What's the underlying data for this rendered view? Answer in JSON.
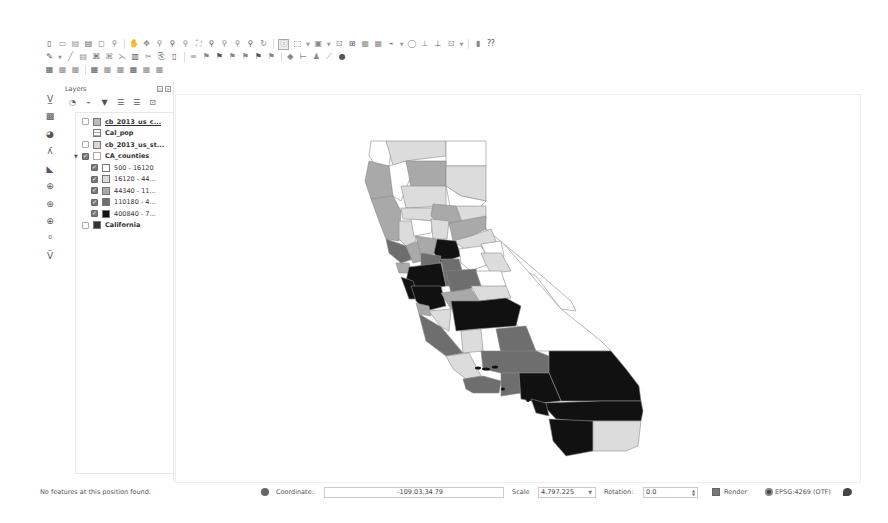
{
  "toolbar": {
    "row1_icons": [
      {
        "name": "new-project-icon",
        "glyph": "▯"
      },
      {
        "name": "open-project-icon",
        "glyph": "▭"
      },
      {
        "name": "save-project-icon",
        "glyph": "▤"
      },
      {
        "name": "save-as-icon",
        "glyph": "▤"
      },
      {
        "name": "new-print-composer-icon",
        "glyph": "◻"
      },
      {
        "name": "composer-manager-icon",
        "glyph": "⚲"
      },
      {
        "name": "pan-map-icon",
        "glyph": "✋"
      },
      {
        "name": "pan-to-selection-icon",
        "glyph": "✥"
      },
      {
        "name": "zoom-in-icon",
        "glyph": "⚲"
      },
      {
        "name": "zoom-out-icon",
        "glyph": "⚲"
      },
      {
        "name": "zoom-full-icon",
        "glyph": "⚲"
      },
      {
        "name": "zoom-to-selection-icon",
        "glyph": "⛶"
      },
      {
        "name": "zoom-to-layer-icon",
        "glyph": "⚲"
      },
      {
        "name": "zoom-native-icon",
        "glyph": "⚲"
      },
      {
        "name": "zoom-last-icon",
        "glyph": "⚲"
      },
      {
        "name": "zoom-next-icon",
        "glyph": "⚲"
      },
      {
        "name": "refresh-icon",
        "glyph": "↻"
      },
      {
        "name": "identify-features-icon",
        "glyph": "ⓘ",
        "active": true
      },
      {
        "name": "select-features-icon",
        "glyph": "⬚",
        "dropdown": true
      },
      {
        "name": "select-by-area-icon",
        "glyph": "▣",
        "dropdown": true
      },
      {
        "name": "deselect-all-icon",
        "glyph": "⊡"
      },
      {
        "name": "select-by-expression-icon",
        "glyph": "⊞"
      },
      {
        "name": "open-attribute-table-icon",
        "glyph": "▦"
      },
      {
        "name": "field-calculator-icon",
        "glyph": "▦"
      },
      {
        "name": "measure-line-icon",
        "glyph": "⌁",
        "dropdown": true
      },
      {
        "name": "map-tips-icon",
        "glyph": "◯"
      },
      {
        "name": "new-bookmark-icon",
        "glyph": "⊥"
      },
      {
        "name": "show-bookmarks-icon",
        "glyph": "⊥"
      },
      {
        "name": "text-annotation-icon",
        "glyph": "⊡",
        "dropdown": true
      },
      {
        "name": "python-console-icon",
        "glyph": "▮"
      },
      {
        "name": "help-icon",
        "glyph": "⁇"
      }
    ],
    "row2_icons": [
      {
        "name": "current-edits-icon",
        "glyph": "✎",
        "dropdown": true
      },
      {
        "name": "toggle-editing-icon",
        "glyph": "╱"
      },
      {
        "name": "save-edits-icon",
        "glyph": "▤"
      },
      {
        "name": "add-feature-icon",
        "glyph": "⌘"
      },
      {
        "name": "move-feature-icon",
        "glyph": "⌘"
      },
      {
        "name": "node-tool-icon",
        "glyph": "⋋"
      },
      {
        "name": "delete-selected-icon",
        "glyph": "▥"
      },
      {
        "name": "cut-features-icon",
        "glyph": "✂"
      },
      {
        "name": "copy-features-icon",
        "glyph": "⎘"
      },
      {
        "name": "paste-features-icon",
        "glyph": "▯"
      },
      {
        "name": "label-tool-icon",
        "glyph": "≡"
      },
      {
        "name": "pin-labels-icon",
        "glyph": "⚑"
      },
      {
        "name": "show-hide-labels-icon",
        "glyph": "⚑"
      },
      {
        "name": "move-label-icon",
        "glyph": "⚑"
      },
      {
        "name": "rotate-label-icon",
        "glyph": "⚑"
      },
      {
        "name": "change-label-icon",
        "glyph": "⚑"
      },
      {
        "name": "label-diagram-icon",
        "glyph": "⚑"
      },
      {
        "name": "gps-tool-icon",
        "glyph": "◆"
      },
      {
        "name": "measure-area-icon",
        "glyph": "⊢"
      },
      {
        "name": "plugin-a-icon",
        "glyph": "♟"
      },
      {
        "name": "plugin-b-icon",
        "glyph": "⟋"
      },
      {
        "name": "plugin-c-icon",
        "glyph": "●"
      }
    ],
    "row3_icons": [
      {
        "name": "add-vector-layer-icon",
        "glyph": "▦"
      },
      {
        "name": "add-raster-layer-icon",
        "glyph": "▦"
      },
      {
        "name": "add-postgis-layer-icon",
        "glyph": "▦"
      },
      {
        "name": "add-spatialite-layer-icon",
        "glyph": "▦"
      },
      {
        "name": "add-mssql-layer-icon",
        "glyph": "▦"
      },
      {
        "name": "add-oracle-layer-icon",
        "glyph": "▦"
      },
      {
        "name": "add-wms-layer-icon",
        "glyph": "▦"
      },
      {
        "name": "add-wcs-layer-icon",
        "glyph": "▦"
      },
      {
        "name": "add-wfs-layer-icon",
        "glyph": "▦"
      }
    ]
  },
  "left_toolbar": {
    "icons": [
      {
        "name": "add-delimited-text-icon",
        "glyph": "V̲"
      },
      {
        "name": "add-raster-tool-icon",
        "glyph": "▩"
      },
      {
        "name": "add-spatialite-tool-icon",
        "glyph": "◕"
      },
      {
        "name": "add-gpx-icon",
        "glyph": "ʎ"
      },
      {
        "name": "add-mssql-tool-icon",
        "glyph": "◣"
      },
      {
        "name": "add-wms-tool-icon",
        "glyph": "⊕"
      },
      {
        "name": "add-wcs-tool-icon",
        "glyph": "⊛"
      },
      {
        "name": "add-wfs-tool-icon",
        "glyph": "⊕"
      },
      {
        "name": "new-shapefile-icon",
        "glyph": "⁰"
      },
      {
        "name": "new-spatialite-layer-icon",
        "glyph": "V̈"
      }
    ]
  },
  "layers_panel": {
    "title": "Layers",
    "toolbar_icons": [
      {
        "name": "open-layer-styling-icon",
        "glyph": "◔"
      },
      {
        "name": "add-group-icon",
        "glyph": "⌁"
      },
      {
        "name": "filter-legend-icon",
        "glyph": "▼"
      },
      {
        "name": "expand-all-icon",
        "glyph": "☰"
      },
      {
        "name": "collapse-all-icon",
        "glyph": "☰"
      },
      {
        "name": "remove-layer-icon",
        "glyph": "⊡"
      }
    ],
    "layers": [
      {
        "label": "cb_2013_us_c...",
        "checked": false,
        "swatch": "#bbbbbb",
        "indent": 0,
        "bold": true,
        "underline": true
      },
      {
        "label": "Cal_pop",
        "checked": null,
        "swatch": "table",
        "indent": 0,
        "bold": true
      },
      {
        "label": "cb_2013_us_st...",
        "checked": false,
        "swatch": "#d8d8d8",
        "indent": 0,
        "bold": true
      },
      {
        "label": "CA_counties",
        "checked": true,
        "swatch": "outline",
        "indent": 0,
        "bold": true,
        "expanded": true
      },
      {
        "label": "500 - 16120",
        "checked": true,
        "swatch": "#ffffff",
        "indent": 1
      },
      {
        "label": "16120 - 44...",
        "checked": true,
        "swatch": "#dcdcdc",
        "indent": 1
      },
      {
        "label": "44340 - 11...",
        "checked": true,
        "swatch": "#a9a9a9",
        "indent": 1
      },
      {
        "label": "110180 - 4...",
        "checked": true,
        "swatch": "#6e6e6e",
        "indent": 1
      },
      {
        "label": "400840 - 7...",
        "checked": true,
        "swatch": "#111111",
        "indent": 1
      },
      {
        "label": "California",
        "checked": false,
        "swatch": "#333333",
        "indent": 0,
        "bold": true
      }
    ]
  },
  "map": {
    "legend_colors": {
      "c0": "#ffffff",
      "c1": "#dcdcdc",
      "c2": "#a9a9a9",
      "c3": "#6e6e6e",
      "c4": "#111111"
    }
  },
  "status_bar": {
    "message": "No features at this position found.",
    "coordinate_label": "Coordinate:",
    "coordinate_value": "-109.03,34.79",
    "scale_label": "Scale",
    "scale_value": "4.797.225",
    "rotation_label": "Rotation:",
    "rotation_value": "0.0",
    "render_label": "Render",
    "render_checked": true,
    "crs_label": "EPSG:4269 (OTF)"
  }
}
